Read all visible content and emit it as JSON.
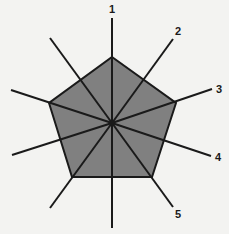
{
  "diagram": {
    "type": "radar-pentagon",
    "colors": {
      "background": "#f3f3f1",
      "fill": "#808080",
      "stroke": "#1a1a1a"
    },
    "center": [
      112,
      123
    ],
    "polygon": [
      [
        112,
        57
      ],
      [
        176,
        103
      ],
      [
        152,
        177
      ],
      [
        72,
        177
      ],
      [
        49,
        103
      ]
    ],
    "spokes": [
      {
        "end": [
          112,
          18
        ],
        "label": "1",
        "label_pos": [
          112,
          13
        ]
      },
      {
        "end": [
          173,
          39
        ],
        "label": "2",
        "label_pos": [
          178,
          35
        ]
      },
      {
        "end": [
          212,
          89
        ],
        "label": "3",
        "label_pos": [
          219,
          93
        ]
      },
      {
        "end": [
          211,
          156
        ],
        "label": "4",
        "label_pos": [
          218,
          161
        ]
      },
      {
        "end": [
          173,
          207
        ],
        "label": "5",
        "label_pos": [
          178,
          218
        ]
      },
      {
        "end": [
          112,
          228
        ],
        "label": ""
      },
      {
        "end": [
          50,
          208
        ],
        "label": ""
      },
      {
        "end": [
          12,
          155
        ],
        "label": ""
      },
      {
        "end": [
          11,
          90
        ],
        "label": ""
      },
      {
        "end": [
          50,
          38
        ],
        "label": ""
      }
    ],
    "labels": [
      "1",
      "2",
      "3",
      "4",
      "5"
    ]
  }
}
